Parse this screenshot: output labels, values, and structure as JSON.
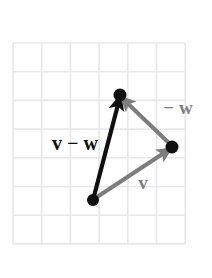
{
  "figure": {
    "title": "",
    "background_color": "#ffffff",
    "grid": {
      "x": 13,
      "y": 43,
      "width": 172,
      "height": 205,
      "cell_size": 28.7,
      "columns": 6,
      "rows": 7,
      "line_color": "#e8e8e8",
      "border_color": "#ededed"
    },
    "colors": {
      "black": "#101010",
      "gray": "#7d7d7d",
      "dot": "#111111"
    },
    "points": [
      {
        "name": "tail",
        "x": 93,
        "y": 200,
        "r": 6
      },
      {
        "name": "head-v-minus-w",
        "x": 120,
        "y": 95,
        "r": 6.5
      },
      {
        "name": "head-v",
        "x": 172,
        "y": 147,
        "r": 6.5
      }
    ],
    "vectors": [
      {
        "name": "v-minus-w",
        "label": "v − w",
        "color": "#101010",
        "width": 4.2,
        "x1": 93,
        "y1": 200,
        "x2": 120,
        "y2": 97,
        "label_x": 75,
        "label_y": 150,
        "label_size": 20
      },
      {
        "name": "v",
        "label": "v",
        "color": "#7d7d7d",
        "width": 4.0,
        "x1": 94,
        "y1": 199,
        "x2": 170,
        "y2": 149,
        "label_x": 143,
        "label_y": 189,
        "label_size": 19
      },
      {
        "name": "minus-w",
        "label": "− w",
        "color": "#7d7d7d",
        "width": 4.0,
        "x1": 171,
        "y1": 145,
        "x2": 122,
        "y2": 98,
        "label_x": 178,
        "label_y": 114,
        "label_size": 19
      }
    ]
  }
}
